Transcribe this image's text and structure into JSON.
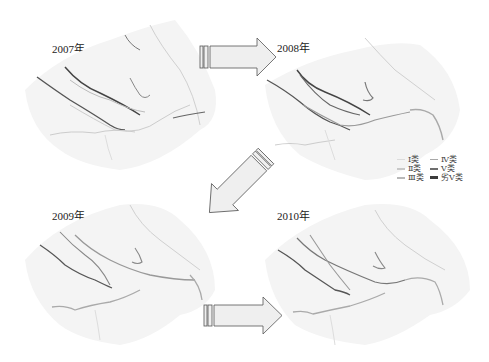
{
  "figure": {
    "panels": [
      {
        "year_label": "2007年"
      },
      {
        "year_label": "2008年"
      },
      {
        "year_label": "2009年"
      },
      {
        "year_label": "2010年"
      }
    ],
    "arrows": [
      {
        "from": "2007年",
        "to": "2008年",
        "direction": "right"
      },
      {
        "from": "2008年",
        "to": "2009年",
        "direction": "down-left"
      },
      {
        "from": "2009年",
        "to": "2010年",
        "direction": "right"
      }
    ],
    "legend": {
      "items": [
        {
          "label": "Ⅰ类",
          "color": "#dcdcdc",
          "weight": 1
        },
        {
          "label": "Ⅳ类",
          "color": "#a8a8a8",
          "weight": 1
        },
        {
          "label": "Ⅱ类",
          "color": "#c8c8c8",
          "weight": 2
        },
        {
          "label": "Ⅴ类",
          "color": "#6e6e6e",
          "weight": 2
        },
        {
          "label": "Ⅲ类",
          "color": "#b8b8b8",
          "weight": 2
        },
        {
          "label": "劣Ⅴ类",
          "color": "#3c3c3c",
          "weight": 3
        }
      ]
    },
    "colors": {
      "map_fill": "#f3f3f3",
      "arrow_fill": "#efefef",
      "arrow_stroke": "#555555"
    }
  }
}
